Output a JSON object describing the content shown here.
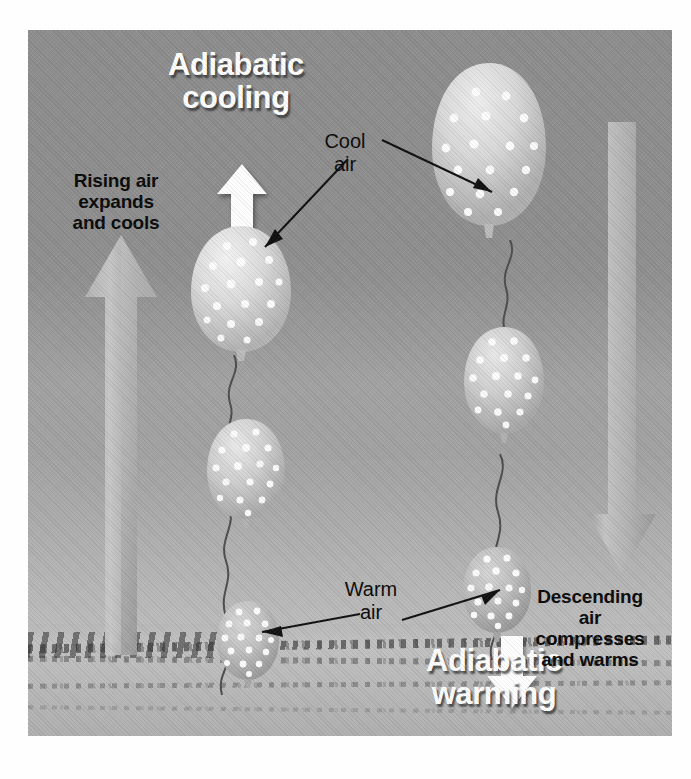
{
  "figure": {
    "kind": "diagram",
    "background_sky_color": "#979797",
    "ground_color": "#bcbcbc"
  },
  "labels": {
    "title_cooling_line1": "Adiabatic",
    "title_cooling_line2": "cooling",
    "title_warming_line1": "Adiabatic",
    "title_warming_line2": "warming",
    "rising_line1": "Rising air",
    "rising_line2": "expands",
    "rising_line3": "and cools",
    "descending_line1": "Descending",
    "descending_line2": "air",
    "descending_line3": "compresses",
    "descending_line4": "and warms",
    "cool_air_line1": "Cool",
    "cool_air_line2": "air",
    "warm_air_line1": "Warm",
    "warm_air_line2": "air"
  },
  "arrows": {
    "white_up": "white-up-arrow",
    "white_down": "white-down-arrow",
    "gray_up": "gray-rising-arrow",
    "gray_down": "gray-descending-arrow"
  },
  "balloons": [
    {
      "id": "left-top",
      "name": "large-expanded-balloon-left",
      "size": "large",
      "dots": 17
    },
    {
      "id": "left-middle",
      "name": "medium-balloon-left",
      "size": "medium",
      "dots": 16
    },
    {
      "id": "left-bottom",
      "name": "small-compressed-balloon-left",
      "size": "small",
      "dots": 16
    },
    {
      "id": "right-top",
      "name": "large-expanded-balloon-right",
      "size": "large",
      "dots": 17
    },
    {
      "id": "right-middle",
      "name": "medium-balloon-right",
      "size": "medium",
      "dots": 16
    },
    {
      "id": "right-bottom",
      "name": "small-compressed-balloon-right",
      "size": "small",
      "dots": 16
    }
  ],
  "colors": {
    "text_dark": "#0b0b0b",
    "text_light": "#ffffff",
    "arrow_gray": "#b0b0b0",
    "balloon_gray": "#c9c9c9"
  }
}
